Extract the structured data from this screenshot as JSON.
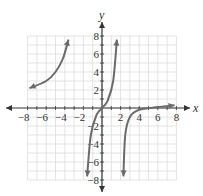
{
  "chart_data": {
    "type": "line",
    "title": "",
    "xlabel": "x",
    "ylabel": "y",
    "xlim": [
      -8,
      8
    ],
    "ylim": [
      -8,
      8
    ],
    "grid": true,
    "xticks": [
      "-8",
      "-6",
      "-4",
      "-2",
      "2",
      "4",
      "6",
      "8"
    ],
    "yticks": [
      "8",
      "6",
      "4",
      "2",
      "-2",
      "-4",
      "-6",
      "-8"
    ],
    "series": [
      {
        "name": "branch-left",
        "points": [
          [
            -7.8,
            2.2
          ],
          [
            -6,
            3
          ],
          [
            -5,
            4
          ],
          [
            -4.2,
            5.5
          ],
          [
            -3.6,
            7.6
          ]
        ]
      },
      {
        "name": "branch-middle",
        "points": [
          [
            -1.6,
            -7.6
          ],
          [
            -1.2,
            -3
          ],
          [
            -0.6,
            -0.8
          ],
          [
            0,
            0
          ],
          [
            0.6,
            0.8
          ],
          [
            1.2,
            3
          ],
          [
            1.6,
            7.6
          ]
        ]
      },
      {
        "name": "branch-right",
        "points": [
          [
            2.3,
            -7.6
          ],
          [
            2.5,
            -3
          ],
          [
            3,
            -1
          ],
          [
            4,
            -0.2
          ],
          [
            6,
            0.1
          ],
          [
            7.8,
            0.3
          ]
        ]
      }
    ],
    "colors": {
      "curve": "#6b6b6b",
      "grid": "#dcdcdc",
      "axis": "#333333"
    }
  }
}
